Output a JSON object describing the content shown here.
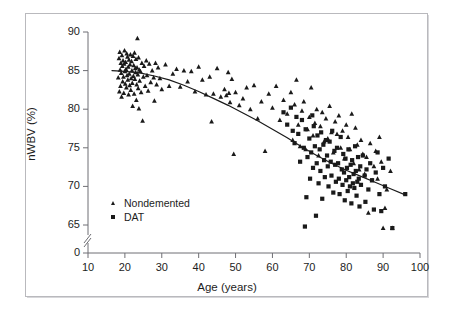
{
  "figure": {
    "background_color": "#ffffff",
    "frame_color": "#b9b9bd",
    "marker_color": "#1a1a1a"
  },
  "axis_titles": {
    "x": "Age (years)",
    "y": "nWBV (%)"
  },
  "legend": {
    "items": [
      {
        "label": "Nondemented",
        "marker": "triangle"
      },
      {
        "label": "DAT",
        "marker": "square"
      }
    ]
  },
  "chart_data": {
    "type": "scatter",
    "title": "",
    "xlabel": "Age (years)",
    "ylabel": "nWBV (%)",
    "xlim": [
      10,
      100
    ],
    "ylim": [
      63,
      90
    ],
    "xticks": [
      10,
      20,
      30,
      40,
      50,
      60,
      70,
      80,
      90,
      100
    ],
    "yticks": [
      0,
      65,
      70,
      75,
      80,
      85,
      90
    ],
    "y_axis_break": true,
    "y_axis_break_note": "axis broken between 0 and 65",
    "grid": false,
    "legend_position": "lower-left-inside",
    "series": [
      {
        "name": "Nondemented",
        "marker": "triangle",
        "color": "#1a1a1a",
        "points": [
          [
            18.2,
            84.1
          ],
          [
            18.4,
            86.6
          ],
          [
            18.5,
            82.3
          ],
          [
            18.6,
            87.4
          ],
          [
            18.7,
            85.1
          ],
          [
            18.8,
            83.0
          ],
          [
            18.9,
            86.0
          ],
          [
            19.0,
            84.7
          ],
          [
            19.1,
            81.6
          ],
          [
            19.2,
            87.0
          ],
          [
            19.3,
            85.6
          ],
          [
            19.4,
            83.6
          ],
          [
            19.5,
            86.3
          ],
          [
            19.6,
            84.2
          ],
          [
            19.7,
            82.1
          ],
          [
            19.8,
            85.9
          ],
          [
            19.9,
            87.6
          ],
          [
            20.0,
            84.9
          ],
          [
            20.1,
            83.3
          ],
          [
            20.2,
            86.1
          ],
          [
            20.3,
            85.2
          ],
          [
            20.4,
            82.8
          ],
          [
            20.5,
            87.2
          ],
          [
            20.6,
            84.4
          ],
          [
            20.7,
            86.8
          ],
          [
            20.8,
            83.8
          ],
          [
            20.9,
            85.5
          ],
          [
            21.0,
            81.9
          ],
          [
            21.1,
            86.4
          ],
          [
            21.2,
            84.6
          ],
          [
            21.3,
            83.1
          ],
          [
            21.4,
            85.8
          ],
          [
            21.5,
            87.1
          ],
          [
            21.6,
            82.5
          ],
          [
            21.7,
            84.0
          ],
          [
            21.8,
            86.2
          ],
          [
            21.9,
            85.0
          ],
          [
            22.0,
            83.4
          ],
          [
            22.1,
            80.4
          ],
          [
            22.2,
            86.9
          ],
          [
            22.3,
            84.3
          ],
          [
            22.4,
            85.7
          ],
          [
            22.5,
            82.0
          ],
          [
            22.6,
            87.3
          ],
          [
            22.7,
            83.9
          ],
          [
            22.8,
            85.3
          ],
          [
            22.9,
            84.8
          ],
          [
            23.0,
            86.5
          ],
          [
            23.1,
            81.2
          ],
          [
            23.2,
            83.2
          ],
          [
            23.3,
            85.4
          ],
          [
            23.4,
            89.2
          ],
          [
            23.5,
            84.5
          ],
          [
            23.6,
            82.7
          ],
          [
            23.7,
            86.7
          ],
          [
            23.8,
            80.1
          ],
          [
            23.9,
            85.1
          ],
          [
            24.0,
            83.7
          ],
          [
            24.2,
            84.9
          ],
          [
            24.4,
            82.2
          ],
          [
            24.6,
            86.0
          ],
          [
            24.8,
            78.5
          ],
          [
            25.0,
            84.2
          ],
          [
            25.2,
            85.6
          ],
          [
            25.5,
            83.0
          ],
          [
            25.8,
            86.3
          ],
          [
            26.0,
            84.4
          ],
          [
            26.3,
            82.4
          ],
          [
            26.6,
            85.9
          ],
          [
            27.0,
            83.5
          ],
          [
            27.4,
            85.0
          ],
          [
            27.8,
            84.1
          ],
          [
            28.0,
            81.1
          ],
          [
            28.3,
            86.0
          ],
          [
            28.6,
            83.2
          ],
          [
            29.0,
            85.4
          ],
          [
            29.5,
            84.0
          ],
          [
            30.0,
            82.6
          ],
          [
            31.0,
            85.8
          ],
          [
            32.0,
            83.0
          ],
          [
            33.0,
            84.6
          ],
          [
            34.0,
            85.2
          ],
          [
            35.0,
            82.9
          ],
          [
            36.0,
            85.0
          ],
          [
            37.0,
            83.6
          ],
          [
            38.0,
            84.9
          ],
          [
            39.0,
            82.3
          ],
          [
            40.0,
            85.5
          ],
          [
            41.0,
            83.8
          ],
          [
            42.0,
            81.9
          ],
          [
            43.0,
            84.2
          ],
          [
            43.5,
            78.4
          ],
          [
            44.0,
            82.0
          ],
          [
            45.0,
            85.3
          ],
          [
            46.0,
            81.6
          ],
          [
            47.0,
            82.6
          ],
          [
            47.5,
            81.8
          ],
          [
            48.0,
            84.8
          ],
          [
            48.2,
            82.1
          ],
          [
            48.5,
            80.9
          ],
          [
            49.0,
            83.9
          ],
          [
            49.5,
            74.2
          ],
          [
            50.0,
            82.2
          ],
          [
            51.0,
            80.5
          ],
          [
            52.0,
            81.4
          ],
          [
            53.0,
            82.8
          ],
          [
            54.0,
            80.0
          ],
          [
            55.0,
            83.1
          ],
          [
            56.0,
            78.8
          ],
          [
            57.0,
            81.0
          ],
          [
            58.0,
            74.6
          ],
          [
            59.0,
            82.0
          ],
          [
            60.0,
            80.2
          ],
          [
            61.0,
            83.0
          ],
          [
            62.0,
            78.6
          ],
          [
            63.0,
            81.2
          ],
          [
            64.0,
            79.4
          ],
          [
            65.0,
            82.2
          ],
          [
            65.5,
            76.0
          ],
          [
            66.0,
            80.6
          ],
          [
            66.5,
            83.8
          ],
          [
            67.0,
            78.0
          ],
          [
            67.5,
            75.2
          ],
          [
            68.0,
            79.8
          ],
          [
            68.5,
            81.0
          ],
          [
            69.0,
            74.8
          ],
          [
            69.5,
            77.4
          ],
          [
            70.0,
            79.0
          ],
          [
            70.5,
            82.8
          ],
          [
            71.0,
            76.6
          ],
          [
            71.5,
            78.2
          ],
          [
            72.0,
            80.0
          ],
          [
            72.5,
            74.0
          ],
          [
            73.0,
            77.8
          ],
          [
            73.5,
            79.6
          ],
          [
            74.0,
            75.8
          ],
          [
            74.5,
            78.8
          ],
          [
            75.0,
            76.2
          ],
          [
            75.5,
            80.4
          ],
          [
            76.0,
            77.0
          ],
          [
            76.5,
            74.4
          ],
          [
            77.0,
            78.4
          ],
          [
            77.5,
            76.8
          ],
          [
            78.0,
            79.2
          ],
          [
            78.5,
            75.0
          ],
          [
            79.0,
            77.2
          ],
          [
            79.5,
            73.6
          ],
          [
            80.0,
            78.0
          ],
          [
            80.5,
            76.4
          ],
          [
            81.0,
            74.8
          ],
          [
            81.5,
            79.4
          ],
          [
            82.0,
            73.0
          ],
          [
            82.5,
            77.6
          ],
          [
            83.0,
            75.4
          ],
          [
            83.5,
            72.2
          ],
          [
            84.0,
            76.0
          ],
          [
            84.5,
            74.2
          ],
          [
            85.0,
            71.6
          ],
          [
            85.5,
            73.8
          ],
          [
            86.0,
            66.6
          ],
          [
            86.5,
            75.6
          ],
          [
            87.0,
            70.8
          ],
          [
            87.5,
            72.6
          ],
          [
            88.0,
            74.6
          ],
          [
            88.5,
            71.0
          ],
          [
            89.0,
            76.4
          ],
          [
            89.5,
            73.2
          ],
          [
            90.0,
            64.6
          ],
          [
            90.5,
            67.2
          ],
          [
            91.0,
            69.6
          ],
          [
            92.0,
            72.0
          ],
          [
            92.5,
            64.6
          ]
        ]
      },
      {
        "name": "DAT",
        "marker": "square",
        "color": "#1a1a1a",
        "points": [
          [
            63.0,
            79.6
          ],
          [
            64.0,
            78.0
          ],
          [
            65.0,
            80.2
          ],
          [
            65.5,
            77.2
          ],
          [
            66.0,
            75.6
          ],
          [
            66.5,
            79.0
          ],
          [
            67.0,
            76.8
          ],
          [
            67.5,
            73.2
          ],
          [
            68.0,
            78.6
          ],
          [
            68.5,
            75.0
          ],
          [
            68.8,
            64.8
          ],
          [
            69.0,
            77.4
          ],
          [
            69.2,
            68.6
          ],
          [
            69.5,
            73.8
          ],
          [
            70.0,
            76.2
          ],
          [
            70.2,
            71.0
          ],
          [
            70.5,
            74.4
          ],
          [
            70.8,
            79.2
          ],
          [
            71.0,
            72.4
          ],
          [
            71.2,
            77.8
          ],
          [
            71.5,
            75.2
          ],
          [
            71.8,
            66.2
          ],
          [
            72.0,
            73.0
          ],
          [
            72.2,
            76.6
          ],
          [
            72.5,
            70.4
          ],
          [
            72.8,
            74.8
          ],
          [
            73.0,
            72.0
          ],
          [
            73.2,
            77.0
          ],
          [
            73.5,
            68.4
          ],
          [
            73.8,
            75.4
          ],
          [
            74.0,
            73.4
          ],
          [
            74.2,
            71.2
          ],
          [
            74.5,
            76.0
          ],
          [
            74.8,
            74.0
          ],
          [
            75.0,
            72.6
          ],
          [
            75.2,
            70.0
          ],
          [
            75.5,
            75.8
          ],
          [
            75.8,
            73.2
          ],
          [
            76.0,
            71.4
          ],
          [
            76.2,
            77.2
          ],
          [
            76.5,
            69.2
          ],
          [
            76.8,
            74.6
          ],
          [
            77.0,
            72.8
          ],
          [
            77.2,
            70.6
          ],
          [
            77.5,
            75.0
          ],
          [
            77.8,
            73.0
          ],
          [
            78.0,
            71.0
          ],
          [
            78.2,
            69.0
          ],
          [
            78.5,
            76.4
          ],
          [
            78.8,
            72.2
          ],
          [
            79.0,
            70.2
          ],
          [
            79.2,
            74.2
          ],
          [
            79.4,
            71.8
          ],
          [
            79.6,
            68.2
          ],
          [
            79.8,
            73.6
          ],
          [
            80.0,
            70.8
          ],
          [
            80.2,
            72.4
          ],
          [
            80.4,
            69.4
          ],
          [
            80.6,
            74.8
          ],
          [
            80.8,
            71.2
          ],
          [
            81.0,
            70.0
          ],
          [
            81.2,
            72.8
          ],
          [
            81.4,
            67.8
          ],
          [
            81.6,
            73.4
          ],
          [
            81.8,
            70.4
          ],
          [
            82.0,
            71.6
          ],
          [
            82.2,
            69.8
          ],
          [
            82.4,
            75.2
          ],
          [
            82.6,
            72.0
          ],
          [
            82.8,
            68.8
          ],
          [
            83.0,
            70.6
          ],
          [
            83.2,
            73.8
          ],
          [
            83.4,
            71.0
          ],
          [
            83.6,
            67.4
          ],
          [
            83.8,
            72.6
          ],
          [
            84.0,
            70.2
          ],
          [
            84.5,
            74.0
          ],
          [
            85.0,
            71.4
          ],
          [
            85.2,
            68.0
          ],
          [
            85.5,
            72.2
          ],
          [
            86.0,
            69.6
          ],
          [
            86.5,
            73.0
          ],
          [
            87.0,
            70.8
          ],
          [
            87.5,
            67.0
          ],
          [
            88.0,
            71.8
          ],
          [
            88.5,
            74.4
          ],
          [
            89.0,
            69.0
          ],
          [
            89.5,
            66.8
          ],
          [
            90.0,
            72.4
          ],
          [
            90.5,
            70.0
          ],
          [
            91.5,
            73.6
          ],
          [
            92.5,
            64.6
          ],
          [
            96.0,
            69.0
          ]
        ]
      }
    ],
    "trend_curve": {
      "name": "fitted trend",
      "color": "#1a1a1a",
      "points": [
        [
          16.5,
          85.0
        ],
        [
          20.0,
          84.9
        ],
        [
          24.0,
          84.7
        ],
        [
          28.0,
          84.3
        ],
        [
          32.0,
          83.8
        ],
        [
          36.0,
          83.1
        ],
        [
          40.0,
          82.3
        ],
        [
          44.0,
          81.4
        ],
        [
          48.0,
          80.5
        ],
        [
          52.0,
          79.5
        ],
        [
          56.0,
          78.5
        ],
        [
          60.0,
          77.4
        ],
        [
          64.0,
          76.3
        ],
        [
          68.0,
          75.1
        ],
        [
          72.0,
          74.0
        ],
        [
          76.0,
          73.0
        ],
        [
          80.0,
          72.1
        ],
        [
          84.0,
          71.3
        ],
        [
          88.0,
          70.5
        ],
        [
          92.0,
          69.7
        ],
        [
          96.0,
          68.9
        ]
      ]
    }
  }
}
